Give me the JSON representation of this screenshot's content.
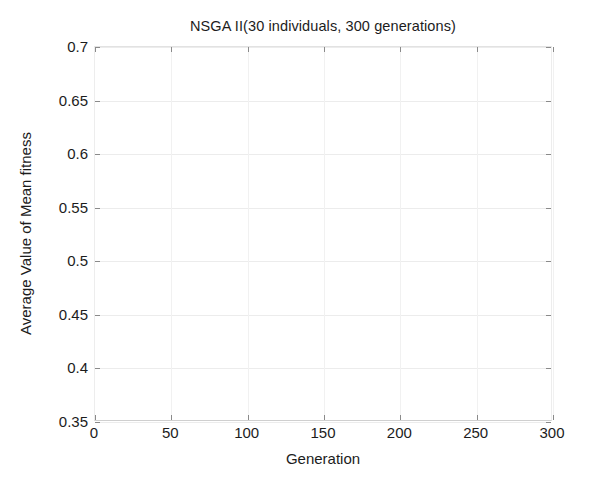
{
  "chart_data": {
    "type": "line",
    "title": "NSGA II(30 individuals, 300 generations)",
    "xlabel": "Generation",
    "ylabel": "Average Value of Mean fitness",
    "xlim": [
      0,
      300
    ],
    "ylim": [
      0.35,
      0.7
    ],
    "xticks": [
      0,
      50,
      100,
      150,
      200,
      250,
      300
    ],
    "xtick_labels": [
      "0",
      "50",
      "100",
      "150",
      "200",
      "250",
      "300"
    ],
    "yticks": [
      0.35,
      0.4,
      0.45,
      0.5,
      0.55,
      0.6,
      0.65,
      0.7
    ],
    "ytick_labels": [
      "0.35",
      "0.4",
      "0.45",
      "0.5",
      "0.55",
      "0.6",
      "0.65",
      "0.7"
    ],
    "grid": true,
    "legend": null,
    "series": [],
    "x": [],
    "values": [],
    "annotations": [],
    "note": "Plot region is empty; no data series are rendered in the axes."
  },
  "style": {
    "background_color": "#ffffff",
    "text_color": "#1c1c1c",
    "grid_color": "#ececec",
    "axis_color": "#cfcfcf",
    "tick_color": "#8a8a8a"
  }
}
